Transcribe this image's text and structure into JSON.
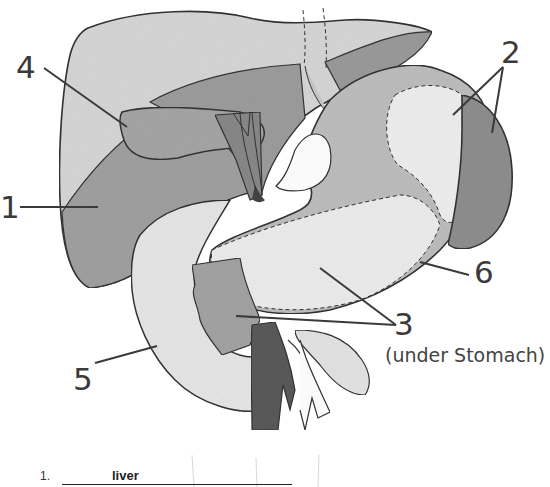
{
  "diagram": {
    "colors": {
      "liver_light": "#d4d4d4",
      "liver_dark": "#9a9a9a",
      "stomach_mid": "#bcbcbc",
      "stomach_light": "#ededed",
      "spleen": "#8e8e8e",
      "vessel": "#5c5c5c",
      "outline": "#333333"
    },
    "labels": [
      {
        "id": "1",
        "text": "1"
      },
      {
        "id": "2",
        "text": "2"
      },
      {
        "id": "3",
        "text": "3",
        "note": "(under Stomach)"
      },
      {
        "id": "4",
        "text": "4"
      },
      {
        "id": "5",
        "text": "5"
      },
      {
        "id": "6",
        "text": "6"
      }
    ]
  },
  "answers": [
    {
      "number": "1.",
      "value": "liver"
    }
  ]
}
